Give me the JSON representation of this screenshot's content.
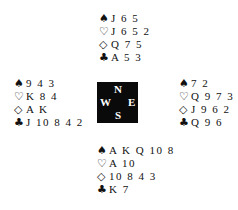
{
  "suit_symbols": {
    "spades": "♠",
    "hearts": "♡",
    "diamonds": "◇",
    "clubs": "♣"
  },
  "compass": {
    "north": "N",
    "south": "S",
    "west": "W",
    "east": "E"
  },
  "hands": {
    "north": {
      "spades": "J 6 5",
      "hearts": "J 6 5 2",
      "diamonds": "Q 7 5",
      "clubs": "A 5 3"
    },
    "west": {
      "spades": "9 4 3",
      "hearts": "K 8 4",
      "diamonds": "A K",
      "clubs": "J 10 8 4 2"
    },
    "east": {
      "spades": "7 2",
      "hearts": "Q 9 7 3",
      "diamonds": "J 9 6 2",
      "clubs": "Q 9 6"
    },
    "south": {
      "spades": "A K Q 10 8",
      "hearts": "A 10",
      "diamonds": "10 8 4 3",
      "clubs": "K 7"
    }
  }
}
